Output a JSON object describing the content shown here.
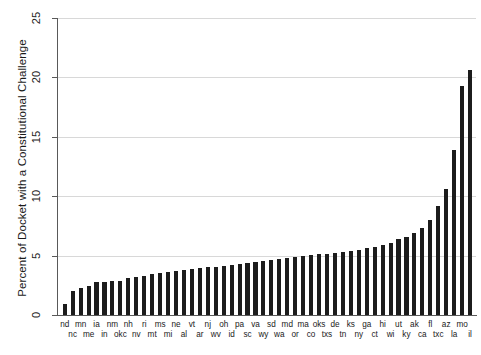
{
  "chart_data": {
    "type": "bar",
    "title": "",
    "xlabel": "",
    "ylabel": "Percent of Docket with a Constitutional Challenge",
    "ylim": [
      0,
      25
    ],
    "yticks": [
      0,
      5,
      10,
      15,
      20,
      25
    ],
    "grid": true,
    "legend": "none",
    "bar_color": "#1c1c1c",
    "categories": [
      "nd",
      "nc",
      "mn",
      "me",
      "ia",
      "in",
      "nm",
      "okc",
      "nh",
      "nv",
      "ri",
      "mt",
      "ms",
      "mi",
      "ne",
      "al",
      "vt",
      "ar",
      "nj",
      "wv",
      "oh",
      "id",
      "pa",
      "sc",
      "va",
      "wy",
      "sd",
      "wa",
      "md",
      "or",
      "ma",
      "co",
      "oks",
      "txs",
      "de",
      "tn",
      "ks",
      "ny",
      "ga",
      "ct",
      "hi",
      "wi",
      "ut",
      "ky",
      "ak",
      "ca",
      "fl",
      "txc",
      "az",
      "la",
      "mo",
      "il"
    ],
    "values": [
      0.9,
      2.05,
      2.3,
      2.45,
      2.75,
      2.8,
      2.85,
      2.9,
      3.1,
      3.2,
      3.3,
      3.45,
      3.5,
      3.6,
      3.7,
      3.8,
      3.9,
      3.95,
      4.0,
      4.05,
      4.15,
      4.2,
      4.3,
      4.4,
      4.5,
      4.55,
      4.6,
      4.7,
      4.8,
      4.9,
      5.0,
      5.05,
      5.1,
      5.15,
      5.2,
      5.3,
      5.4,
      5.5,
      5.6,
      5.7,
      5.9,
      6.1,
      6.4,
      6.6,
      6.9,
      7.3,
      8.0,
      9.2,
      10.6,
      13.9,
      19.3,
      20.6
    ]
  },
  "axis": {
    "y_tick_labels": [
      "0",
      "5",
      "10",
      "15",
      "20",
      "25"
    ]
  }
}
